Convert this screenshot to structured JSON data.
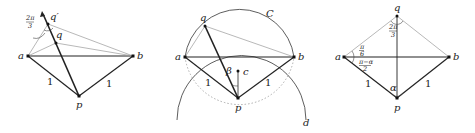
{
  "figures": [
    {
      "id": "left",
      "points": {
        "a": "a",
        "b": "b",
        "p": "p",
        "q": "q",
        "q_prime": "q′"
      },
      "edge_labels": {
        "ap": "1",
        "bp": "1"
      },
      "angle_label": {
        "num": "2π",
        "den": "3"
      }
    },
    {
      "id": "middle",
      "points": {
        "a": "a",
        "b": "b",
        "p": "p",
        "q": "q",
        "c": "c"
      },
      "edge_labels": {
        "ap": "1",
        "bp": "1"
      },
      "angle_label": "β",
      "circle_labels": {
        "C": "C",
        "d": "d"
      }
    },
    {
      "id": "right",
      "points": {
        "a": "a",
        "b": "b",
        "p": "p",
        "q": "q"
      },
      "edge_labels": {
        "ap": "1",
        "bp": "1"
      },
      "angle_labels": {
        "q": {
          "num": "2π",
          "den": "3"
        },
        "a_upper": {
          "num": "π",
          "den": "6"
        },
        "a_lower": {
          "num": "π−α",
          "den": "2"
        },
        "p": "α"
      }
    }
  ]
}
